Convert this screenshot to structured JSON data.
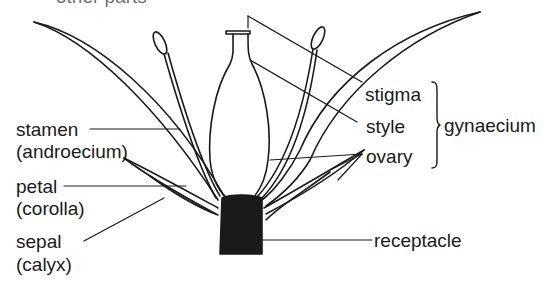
{
  "title_cut": "other parts",
  "labels": {
    "stamen": "stamen",
    "androecium": "(androecium)",
    "petal": "petal",
    "corolla": "(corolla)",
    "sepal": "sepal",
    "calyx": "(calyx)",
    "stigma": "stigma",
    "style": "style",
    "ovary": "ovary",
    "gynaecium": "gynaecium",
    "receptacle": "receptacle"
  },
  "colors": {
    "ink": "#1a1a1a",
    "background": "#ffffff"
  }
}
